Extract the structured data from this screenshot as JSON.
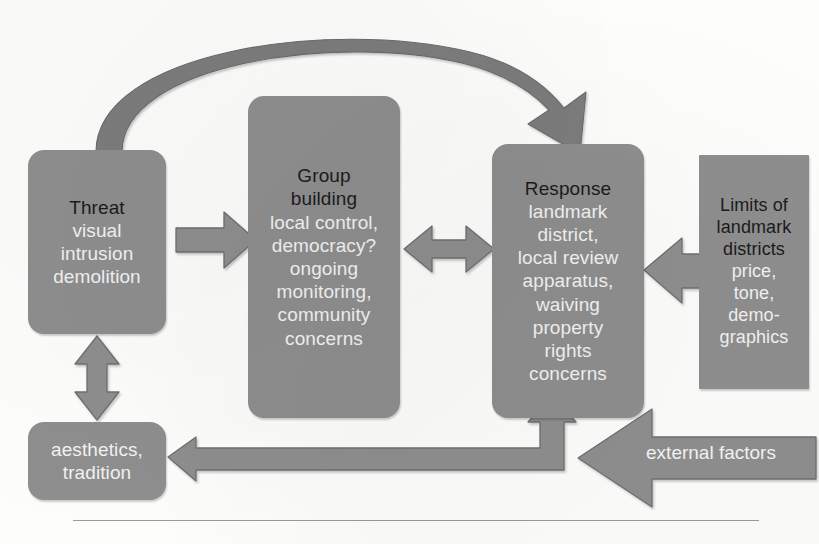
{
  "diagram": {
    "palette": {
      "box_fill": "#8e8e8e",
      "arrow_fill": "#8e8e8e",
      "arrow_stroke": "#6f6f6f",
      "curved_arrow_fill": "#7c7c7c",
      "header_text": "#1b1b1b",
      "body_text": "#f2f2f2",
      "page_background": "#fdfdfc",
      "rule_color": "#9a9a9a"
    },
    "nodes": [
      {
        "id": "threat",
        "shape": "rounded-rect",
        "header": "Threat",
        "lines": [
          "visual",
          "intrusion",
          "demolition"
        ]
      },
      {
        "id": "group-building",
        "shape": "rounded-rect",
        "header": "Group",
        "header2": "building",
        "lines": [
          "local control,",
          "democracy?",
          "ongoing",
          "monitoring,",
          "community",
          "concerns"
        ]
      },
      {
        "id": "response",
        "shape": "rounded-rect",
        "header": "Response",
        "lines": [
          "landmark",
          "district,",
          "local review",
          "apparatus,",
          "waiving",
          "property",
          "rights",
          "concerns"
        ]
      },
      {
        "id": "limits-of-landmark-districts",
        "shape": "rect",
        "header": "Limits of",
        "header2": "landmark",
        "header3": "districts",
        "lines": [
          "price,",
          "tone,",
          "demo-",
          "graphics"
        ]
      },
      {
        "id": "aesthetics-tradition",
        "shape": "rounded-rect",
        "header": "",
        "lines": [
          "aesthetics,",
          "tradition"
        ]
      }
    ],
    "connectors": [
      {
        "id": "threat-to-response-curve",
        "style": "curved-block-arrow",
        "from": "threat",
        "to": "response",
        "heads": "single",
        "direction": "left-to-right-over-top"
      },
      {
        "id": "threat-to-group",
        "style": "block-arrow",
        "from": "threat",
        "to": "group-building",
        "heads": "single",
        "direction": "right"
      },
      {
        "id": "group-to-response",
        "style": "block-arrow",
        "from": "group-building",
        "to": "response",
        "heads": "double",
        "direction": "horizontal"
      },
      {
        "id": "limits-to-response",
        "style": "block-arrow",
        "from": "limits-of-landmark-districts",
        "to": "response",
        "heads": "single",
        "direction": "left"
      },
      {
        "id": "threat-to-aesthetics",
        "style": "block-arrow",
        "from": "threat",
        "to": "aesthetics-tradition",
        "heads": "double",
        "direction": "vertical"
      },
      {
        "id": "elbow-response-aesthetics",
        "style": "elbow-block-arrow",
        "from": "response",
        "to": "aesthetics-tradition",
        "heads": "double",
        "direction": "up-and-left"
      },
      {
        "id": "external-factors-arrow",
        "style": "block-arrow",
        "from": "external factors",
        "to": "elbow-response-aesthetics",
        "heads": "single",
        "direction": "left",
        "label": "external factors"
      }
    ],
    "labels": {
      "external_factors": "external factors"
    }
  }
}
